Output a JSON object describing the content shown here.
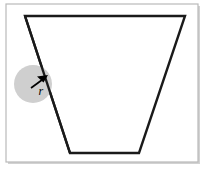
{
  "figure": {
    "canvas": {
      "width": 205,
      "height": 170,
      "background": "#ffffff"
    },
    "frame": {
      "name": "panel-border",
      "x": 6,
      "y": 4,
      "width": 192,
      "height": 158,
      "stroke": "#b9b9b9",
      "stroke_width": 1.2,
      "fill": "#ffffff",
      "shadow": "#d2d2d2"
    },
    "shape": {
      "name": "trapezoid",
      "points": "25,16 185,16 139,153 70,153",
      "stroke": "#1a1a1a",
      "stroke_width": 2.4,
      "fill": "none",
      "vertices": [
        {
          "label": "top-left",
          "x": 25,
          "y": 16
        },
        {
          "label": "top-right",
          "x": 185,
          "y": 16
        },
        {
          "label": "bottom-right",
          "x": 139,
          "y": 153
        },
        {
          "label": "bottom-left",
          "x": 70,
          "y": 153
        }
      ]
    },
    "circle": {
      "name": "shaded-circle",
      "cx": 33,
      "cy": 84,
      "r": 19,
      "fill": "#cfcfcf",
      "stroke": "none",
      "opacity": 1
    },
    "arrow": {
      "name": "radius-arrow",
      "x1": 31,
      "y1": 88,
      "x2": 47,
      "y2": 76,
      "stroke": "#000000",
      "stroke_width": 1.6,
      "head_points": "47,76 39,76 44,82"
    },
    "label": {
      "name": "radius-label",
      "text": "r",
      "x": 39,
      "y": 95,
      "font_size": 12,
      "color": "#000000",
      "style": "italic"
    }
  }
}
